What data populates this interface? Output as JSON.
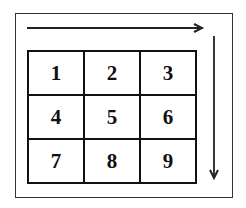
{
  "diagram": {
    "grid": [
      [
        "1",
        "2",
        "3"
      ],
      [
        "4",
        "5",
        "6"
      ],
      [
        "7",
        "8",
        "9"
      ]
    ],
    "arrows": [
      {
        "direction": "right",
        "position": "top"
      },
      {
        "direction": "down",
        "position": "right"
      }
    ]
  }
}
